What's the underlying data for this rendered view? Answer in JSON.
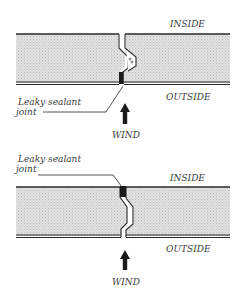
{
  "diagrams": [
    {
      "id": "top",
      "labels": {
        "inside": "INSIDE",
        "outside": "OUTSIDE",
        "sealant_line1": "Leaky sealant",
        "sealant_line2": "joint",
        "wind": "WIND"
      },
      "sealant_position": "outside face"
    },
    {
      "id": "bottom",
      "labels": {
        "inside": "INSIDE",
        "outside": "OUTSIDE",
        "sealant_line1": "Leaky sealant",
        "sealant_line2": "joint",
        "wind": "WIND"
      },
      "sealant_position": "inside face"
    }
  ],
  "colors": {
    "panel_fill": "#d9d9d9",
    "line": "#2a2a2a",
    "sealant": "#1a1a1a",
    "text": "#3a3a3a"
  }
}
